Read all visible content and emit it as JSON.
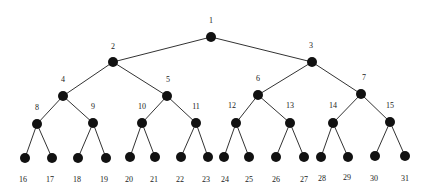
{
  "diagram": {
    "type": "complete-binary-tree",
    "colors": {
      "node": "#111111",
      "edge": "#333333",
      "label": "#222222",
      "background": "#ffffff"
    },
    "nodes": [
      {
        "id": 1,
        "x": 211,
        "y": 37,
        "lx": 211,
        "ly": 23
      },
      {
        "id": 2,
        "x": 113,
        "y": 62,
        "lx": 113,
        "ly": 49
      },
      {
        "id": 3,
        "x": 312,
        "y": 62,
        "lx": 311,
        "ly": 48
      },
      {
        "id": 4,
        "x": 63,
        "y": 96,
        "lx": 63,
        "ly": 82
      },
      {
        "id": 5,
        "x": 167,
        "y": 96,
        "lx": 168,
        "ly": 82
      },
      {
        "id": 6,
        "x": 258,
        "y": 95,
        "lx": 258,
        "ly": 81
      },
      {
        "id": 7,
        "x": 361,
        "y": 94,
        "lx": 364,
        "ly": 80
      },
      {
        "id": 8,
        "x": 37,
        "y": 124,
        "lx": 37,
        "ly": 110
      },
      {
        "id": 9,
        "x": 93,
        "y": 123,
        "lx": 93,
        "ly": 109
      },
      {
        "id": 10,
        "x": 142,
        "y": 123,
        "lx": 142,
        "ly": 109
      },
      {
        "id": 11,
        "x": 196,
        "y": 123,
        "lx": 196,
        "ly": 109
      },
      {
        "id": 12,
        "x": 236,
        "y": 123,
        "lx": 232,
        "ly": 108
      },
      {
        "id": 13,
        "x": 290,
        "y": 123,
        "lx": 290,
        "ly": 108
      },
      {
        "id": 14,
        "x": 333,
        "y": 123,
        "lx": 333,
        "ly": 108
      },
      {
        "id": 15,
        "x": 390,
        "y": 122,
        "lx": 390,
        "ly": 108
      },
      {
        "id": 16,
        "x": 25,
        "y": 158,
        "lx": 23,
        "ly": 182
      },
      {
        "id": 17,
        "x": 52,
        "y": 158,
        "lx": 50,
        "ly": 182
      },
      {
        "id": 18,
        "x": 78,
        "y": 158,
        "lx": 77,
        "ly": 182
      },
      {
        "id": 19,
        "x": 106,
        "y": 158,
        "lx": 104,
        "ly": 182
      },
      {
        "id": 20,
        "x": 130,
        "y": 157,
        "lx": 129,
        "ly": 182
      },
      {
        "id": 21,
        "x": 155,
        "y": 157,
        "lx": 154,
        "ly": 182
      },
      {
        "id": 22,
        "x": 181,
        "y": 157,
        "lx": 180,
        "ly": 182
      },
      {
        "id": 23,
        "x": 208,
        "y": 157,
        "lx": 206,
        "ly": 182
      },
      {
        "id": 24,
        "x": 224,
        "y": 157,
        "lx": 225,
        "ly": 182
      },
      {
        "id": 25,
        "x": 249,
        "y": 157,
        "lx": 249,
        "ly": 182
      },
      {
        "id": 26,
        "x": 276,
        "y": 157,
        "lx": 276,
        "ly": 182
      },
      {
        "id": 27,
        "x": 304,
        "y": 157,
        "lx": 304,
        "ly": 182
      },
      {
        "id": 28,
        "x": 321,
        "y": 157,
        "lx": 322,
        "ly": 181
      },
      {
        "id": 29,
        "x": 348,
        "y": 157,
        "lx": 347,
        "ly": 180
      },
      {
        "id": 30,
        "x": 375,
        "y": 156,
        "lx": 374,
        "ly": 181
      },
      {
        "id": 31,
        "x": 405,
        "y": 156,
        "lx": 405,
        "ly": 181
      }
    ]
  }
}
